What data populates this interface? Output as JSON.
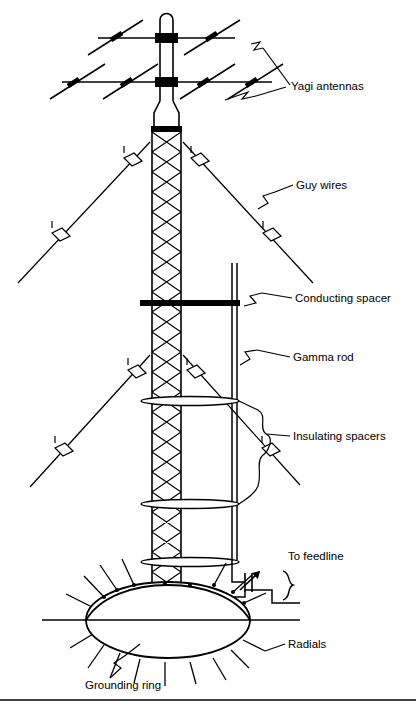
{
  "figure": {
    "type": "technical-line-diagram",
    "background_color": "#ffffff",
    "line_color": "#000000",
    "bottom_rule": true
  },
  "labels": {
    "yagi_antennas": "Yagi antennas",
    "guy_wires": "Guy wires",
    "conducting_spacer": "Conducting spacer",
    "gamma_rod": "Gamma rod",
    "insulating_spacers": "Insulating spacers",
    "to_feedline": "To feedline",
    "radials": "Radials",
    "grounding_ring": "Grounding ring"
  },
  "components": {
    "mast": {
      "name": "antenna-mast",
      "description": "Vertical tubular mast with rounded cap at top"
    },
    "yagi_booms": [
      {
        "name": "upper-yagi-boom",
        "elements": 4
      },
      {
        "name": "lower-yagi-boom",
        "elements": 6
      }
    ],
    "tower": {
      "name": "lattice-tower",
      "description": "X-braced vertical lattice tower section"
    },
    "guy_wire_sets": [
      {
        "name": "upper-guy-pair",
        "insulators_per_side": 2
      },
      {
        "name": "lower-guy-pair",
        "insulators_per_side": 2
      }
    ],
    "conducting_spacer": {
      "name": "conducting-spacer-bar",
      "style": "solid thick black bar"
    },
    "gamma_rod": {
      "name": "gamma-rod",
      "style": "vertical double line parallel to tower"
    },
    "insulating_spacers": [
      {
        "name": "insulating-spacer-upper"
      },
      {
        "name": "insulating-spacer-middle"
      },
      {
        "name": "insulating-spacer-lower"
      }
    ],
    "variable_capacitor": {
      "name": "variable-capacitor",
      "style": "capacitor plates with diagonal arrow"
    },
    "coax_brace": {
      "name": "coax-feedline-brace",
      "style": "curly brace indicating coaxial feedline"
    },
    "grounding_ring": {
      "name": "grounding-ring",
      "style": "ellipse in perspective"
    },
    "radials": {
      "name": "ground-radials",
      "count": 18
    }
  },
  "colors": {
    "ink": "#000000",
    "paper": "#ffffff"
  }
}
